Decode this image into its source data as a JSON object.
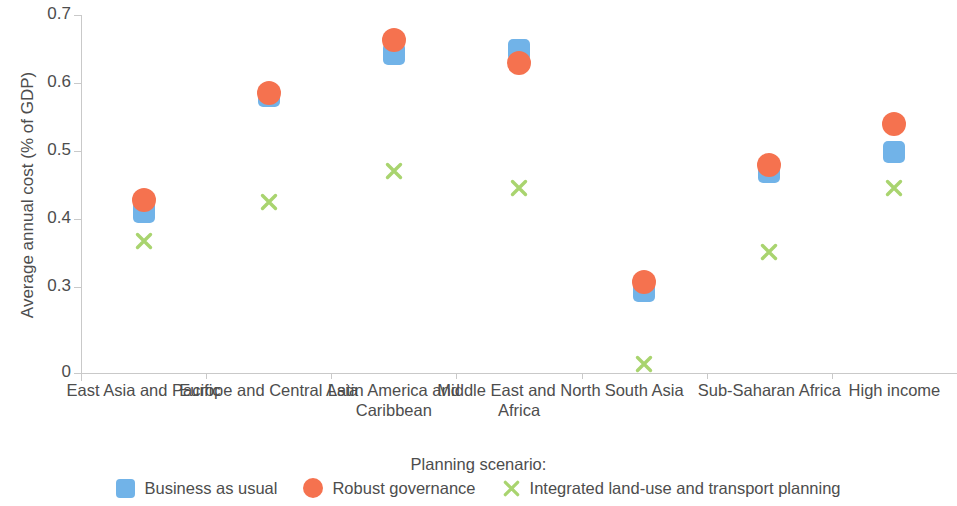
{
  "chart_data": {
    "type": "scatter",
    "title": "",
    "xlabel": "",
    "ylabel": "Average annual cost (% of GDP)",
    "ylim": [
      0,
      0.7
    ],
    "yticks": [
      "0",
      "0.3",
      "0.4",
      "0.5",
      "0.6",
      "0.7"
    ],
    "ytick_values": [
      0,
      0.3,
      0.4,
      0.5,
      0.6,
      0.7
    ],
    "axis_break": "y axis breaks between 0 and 0.3",
    "grid": false,
    "legend_position": "bottom",
    "legend_title": "Planning scenario:",
    "categories": [
      "East Asia and Pacific",
      "Europe and Central Asia",
      "Latin America and Caribbean",
      "Middle East and North Africa",
      "South Asia",
      "Sub-Saharan Africa",
      "High income"
    ],
    "series": [
      {
        "name": "Business as usual",
        "marker": "square",
        "color": "#71b3e8",
        "values": [
          0.41,
          0.581,
          0.642,
          0.648,
          0.287,
          0.469,
          0.498
        ]
      },
      {
        "name": "Robust governance",
        "marker": "circle",
        "color": "#f5724f",
        "values": [
          0.428,
          0.585,
          0.663,
          0.629,
          0.307,
          0.48,
          0.54
        ]
      },
      {
        "name": "Integrated land-use and transport planning",
        "marker": "cross",
        "color": "#a9d46f",
        "values": [
          0.368,
          0.425,
          0.47,
          0.445,
          0.03,
          0.351,
          0.446
        ]
      }
    ]
  },
  "colors": {
    "blue": "#71b3e8",
    "orange": "#f5724f",
    "green": "#a9d46f",
    "axis": "#c9c9c9",
    "text": "#4d4d4d"
  }
}
